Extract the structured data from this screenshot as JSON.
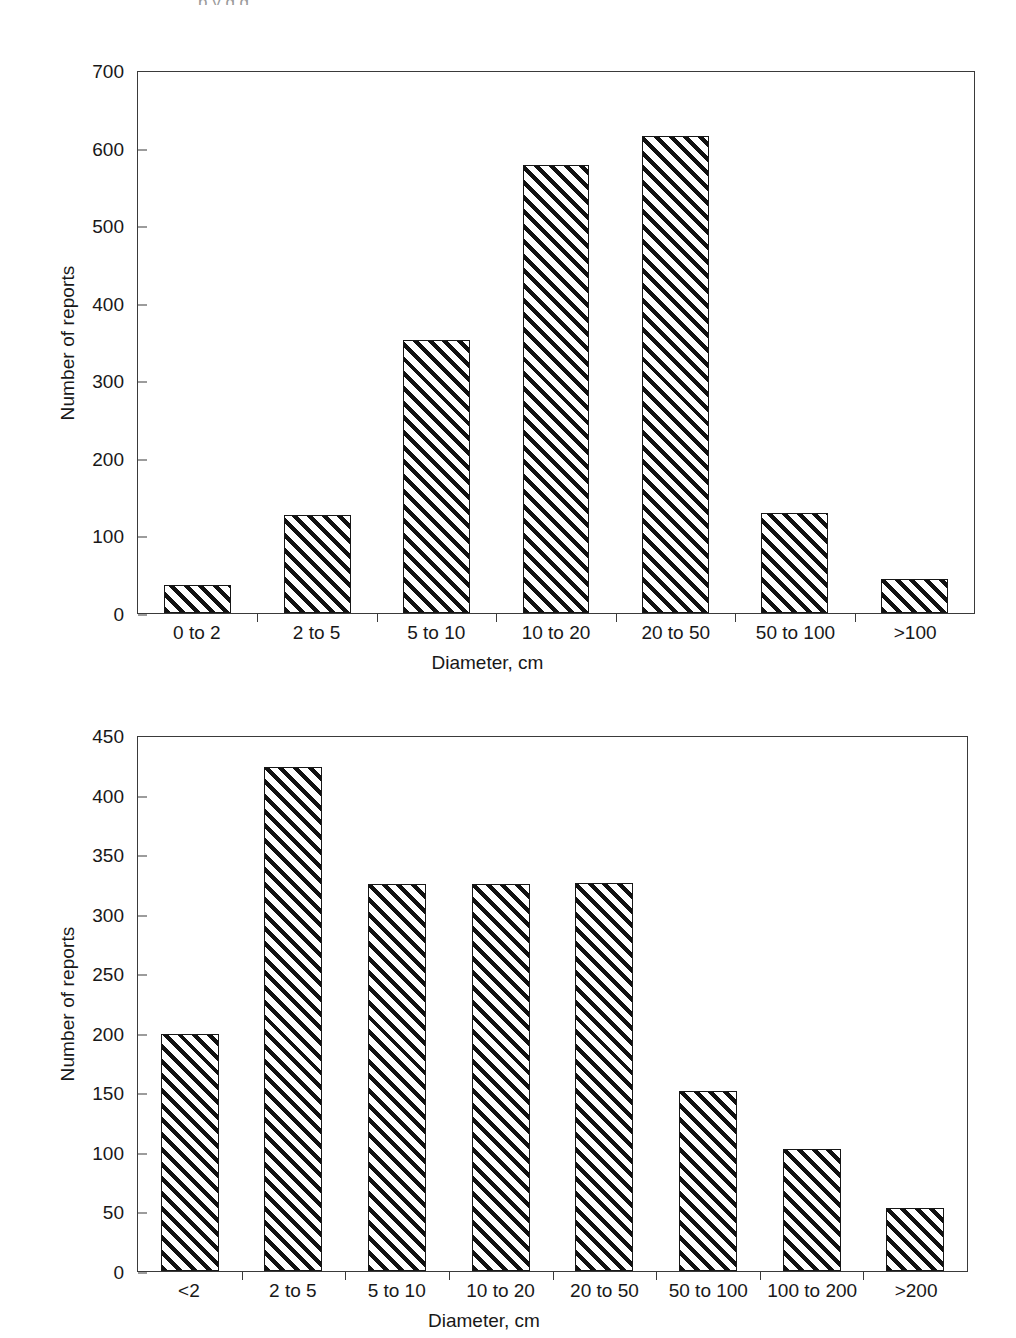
{
  "document": {
    "background_color": "#ffffff",
    "ink_color": "#181818",
    "clipped_caption_fragment": "p   y g g"
  },
  "chart_data": [
    {
      "id": "top",
      "type": "bar",
      "title": "",
      "xlabel": "Diameter, cm",
      "ylabel": "Number of reports",
      "categories": [
        "0 to 2",
        "2 to 5",
        "5 to 10",
        "10 to 20",
        "20 to 50",
        "50 to 100",
        ">100"
      ],
      "values": [
        36,
        127,
        353,
        580,
        617,
        129,
        44
      ],
      "ylim": [
        0,
        700
      ],
      "yticks": [
        0,
        100,
        200,
        300,
        400,
        500,
        600,
        700
      ],
      "ytick_labels": [
        "0",
        "100",
        "200",
        "300",
        "400",
        "500",
        "600",
        "700"
      ],
      "grid": false,
      "legend": "none",
      "bar_fill": "diagonal-hatch",
      "bar_edge_color": "#171717"
    },
    {
      "id": "bottom",
      "type": "bar",
      "title": "",
      "xlabel": "Diameter, cm",
      "ylabel": "Number of reports",
      "categories": [
        "<2",
        "2 to 5",
        "5 to 10",
        "10 to 20",
        "20 to 50",
        "50 to 100",
        "100 to 200",
        ">200"
      ],
      "values": [
        200,
        425,
        326,
        326,
        327,
        152,
        103,
        53
      ],
      "ylim": [
        0,
        450
      ],
      "yticks": [
        0,
        50,
        100,
        150,
        200,
        250,
        300,
        350,
        400,
        450
      ],
      "ytick_labels": [
        "0",
        "50",
        "100",
        "150",
        "200",
        "250",
        "300",
        "350",
        "400",
        "450"
      ],
      "grid": false,
      "legend": "none",
      "bar_fill": "diagonal-hatch",
      "bar_edge_color": "#171717"
    }
  ]
}
